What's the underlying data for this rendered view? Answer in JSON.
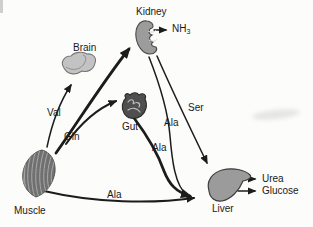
{
  "canvas": {
    "width": 313,
    "height": 227
  },
  "colors": {
    "background": "#fcfcfa",
    "ink": "#1c1c1c",
    "brain_fill": "#c3c3c3",
    "kidney_fill": "#9c9c9c",
    "gut_fill": "#4f4f4f",
    "muscle_fill": "#707070",
    "liver_fill": "#9b9b9b"
  },
  "organs": {
    "kidney": "Kidney",
    "brain": "Brain",
    "gut": "Gut",
    "muscle": "Muscle",
    "liver": "Liver"
  },
  "metabolites": {
    "val": "Val",
    "gln": "Gln",
    "ser": "Ser",
    "ala_kidney_to_liver": "Ala",
    "ala_gut_to_liver": "Ala",
    "ala_muscle_to_liver": "Ala",
    "nh3_base": "NH",
    "nh3_sub": "3",
    "urea": "Urea",
    "glucose": "Glucose"
  },
  "flows": [
    {
      "from": "Muscle",
      "to": "Brain",
      "label": "Val"
    },
    {
      "from": "Muscle",
      "to": "Kidney",
      "label": "Gln"
    },
    {
      "from": "Muscle",
      "to": "Gut",
      "label": "Gln"
    },
    {
      "from": "Muscle",
      "to": "Liver",
      "label": "Ala"
    },
    {
      "from": "Gut",
      "to": "Liver",
      "label": "Ala"
    },
    {
      "from": "Kidney",
      "to": "Liver",
      "label": "Ala"
    },
    {
      "from": "Kidney",
      "to": "Liver",
      "label": "Ser"
    },
    {
      "from": "Kidney",
      "to": "NH3",
      "label": ""
    },
    {
      "from": "Liver",
      "to": "Urea",
      "label": ""
    },
    {
      "from": "Liver",
      "to": "Glucose",
      "label": ""
    }
  ]
}
